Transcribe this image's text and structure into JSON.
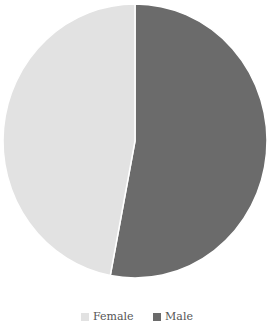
{
  "chart_data": {
    "type": "pie",
    "title": "",
    "categories": [
      "Male",
      "Female"
    ],
    "values": [
      53,
      47
    ],
    "colors": [
      "#6b6b6b",
      "#e2e2e2"
    ],
    "start_angle_deg": 0,
    "direction": "clockwise",
    "legend_position": "bottom",
    "legend": [
      "Female",
      "Male"
    ]
  },
  "legend": {
    "items": [
      {
        "label": "Female",
        "color": "#e2e2e2"
      },
      {
        "label": "Male",
        "color": "#6b6b6b"
      }
    ]
  }
}
